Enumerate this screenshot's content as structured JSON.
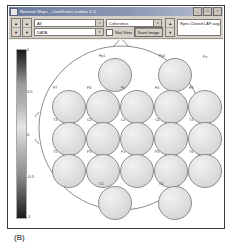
{
  "window": {
    "title": "Network Maps - Coefficient  studies 1-3",
    "icon": "app-window-icon",
    "buttons": [
      {
        "name": "minimize",
        "glyph": "_"
      },
      {
        "name": "maximize",
        "glyph": "□"
      },
      {
        "name": "close",
        "glyph": "×"
      }
    ]
  },
  "toolbar": {
    "spinners": [
      {
        "name": "band-spinner",
        "up": "▲",
        "down": "▼"
      },
      {
        "name": "subject-spinner",
        "up": "▲",
        "down": "▼"
      },
      {
        "name": "threshold-spinner",
        "up": "▲",
        "down": "▼"
      }
    ],
    "select_band": {
      "value": "All",
      "arrow": "▾"
    },
    "select_type": {
      "value": "DATA",
      "arrow": "▾"
    },
    "select_condition": {
      "value": "Coherence",
      "arrow": "▾"
    },
    "stat_view": {
      "label": "Stat View",
      "checked": false
    },
    "save_image": {
      "label": "Save Image"
    },
    "info_field": {
      "value": "Eyes Closed LAP   avg/pz 1.0"
    }
  },
  "colorbar": {
    "ticks": [
      "1",
      "0.5",
      "0",
      "-0.5",
      "-1"
    ],
    "high_color": "#1a1a1a",
    "mid_color": "#b5b5b5",
    "low_color": "#1a1a1a"
  },
  "head_map": {
    "annotation": "Fz",
    "electrodes": [
      {
        "label": "Fp1",
        "x": 63,
        "y": 18,
        "r": 17
      },
      {
        "label": "Fp2",
        "x": 123,
        "y": 18,
        "r": 17
      },
      {
        "label": "F7",
        "x": 17,
        "y": 50,
        "r": 17
      },
      {
        "label": "F3",
        "x": 51,
        "y": 50,
        "r": 17
      },
      {
        "label": "Fz",
        "x": 85,
        "y": 50,
        "r": 17
      },
      {
        "label": "F4",
        "x": 119,
        "y": 50,
        "r": 17
      },
      {
        "label": "F8",
        "x": 153,
        "y": 50,
        "r": 17
      },
      {
        "label": "T3",
        "x": 17,
        "y": 82,
        "r": 17
      },
      {
        "label": "C3",
        "x": 51,
        "y": 82,
        "r": 17
      },
      {
        "label": "Cz",
        "x": 85,
        "y": 82,
        "r": 17
      },
      {
        "label": "C4",
        "x": 119,
        "y": 82,
        "r": 17
      },
      {
        "label": "T4",
        "x": 153,
        "y": 82,
        "r": 17
      },
      {
        "label": "T5",
        "x": 17,
        "y": 114,
        "r": 17
      },
      {
        "label": "P3",
        "x": 51,
        "y": 114,
        "r": 17
      },
      {
        "label": "Pz",
        "x": 85,
        "y": 114,
        "r": 17
      },
      {
        "label": "P4",
        "x": 119,
        "y": 114,
        "r": 17
      },
      {
        "label": "T6",
        "x": 153,
        "y": 114,
        "r": 17
      },
      {
        "label": "O1",
        "x": 63,
        "y": 146,
        "r": 17
      },
      {
        "label": "O2",
        "x": 123,
        "y": 146,
        "r": 17
      }
    ]
  },
  "caption": "(B)"
}
